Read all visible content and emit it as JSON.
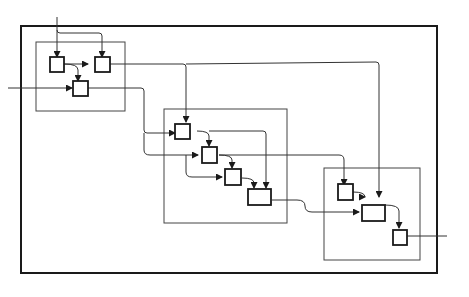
{
  "diagram": {
    "type": "hierarchical block diagram",
    "groups": [
      {
        "id": "group-1",
        "nodes": [
          "a1",
          "a2",
          "a3"
        ]
      },
      {
        "id": "group-2",
        "nodes": [
          "b1",
          "b2",
          "b3",
          "b4"
        ]
      },
      {
        "id": "group-3",
        "nodes": [
          "c1",
          "c2",
          "c3"
        ]
      }
    ],
    "nodes": [
      "a1",
      "a2",
      "a3",
      "b1",
      "b2",
      "b3",
      "b4",
      "c1",
      "c2",
      "c3"
    ],
    "edges": [
      [
        "input-top",
        "a1"
      ],
      [
        "input-top",
        "a2"
      ],
      [
        "a1",
        "a2"
      ],
      [
        "a1",
        "a3"
      ],
      [
        "input-left",
        "a3"
      ],
      [
        "a2",
        "b1"
      ],
      [
        "a2",
        "c2"
      ],
      [
        "a3",
        "b1"
      ],
      [
        "a3",
        "b2"
      ],
      [
        "a3",
        "b3"
      ],
      [
        "b1",
        "b2"
      ],
      [
        "b2",
        "b3"
      ],
      [
        "b2",
        "c1"
      ],
      [
        "b3",
        "b4"
      ],
      [
        "b1",
        "b4"
      ],
      [
        "b4",
        "c2"
      ],
      [
        "c1",
        "c2"
      ],
      [
        "c2",
        "c3"
      ],
      [
        "c3",
        "output-right"
      ]
    ]
  }
}
